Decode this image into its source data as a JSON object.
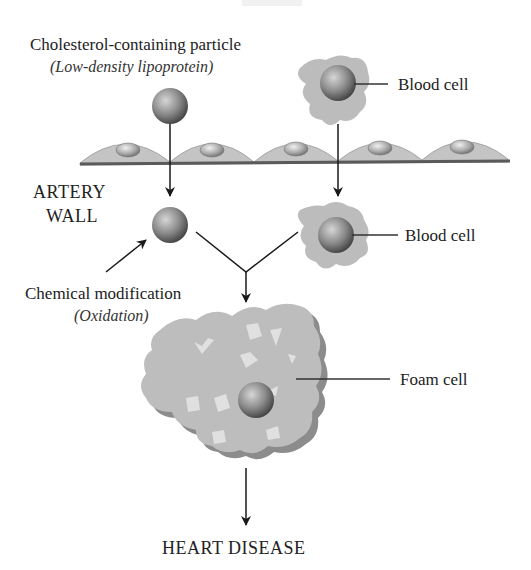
{
  "diagram": {
    "top_label_cropped": "BLOOD",
    "labels": {
      "ldl_title": "Cholesterol-containing particle",
      "ldl_subtitle": "(Low-density lipoprotein)",
      "blood_cell_top": "Blood cell",
      "artery_wall_line1": "ARTERY",
      "artery_wall_line2": "WALL",
      "blood_cell_wall": "Blood cell",
      "chem_mod_title": "Chemical modification",
      "chem_mod_subtitle": "(Oxidation)",
      "foam_cell": "Foam cell",
      "outcome": "HEART DISEASE"
    },
    "colors": {
      "sphere_light": "#c8c8c8",
      "sphere_dark": "#4a4a4a",
      "cell_fill": "#bdbdbd",
      "cell_shadow": "#8c8c8c",
      "wall_fill": "#c4c4c4",
      "wall_base": "#5a5a5a",
      "arrow": "#1a1a1a"
    },
    "flow": [
      "Cholesterol-containing particle crosses artery wall",
      "Blood cell crosses artery wall",
      "Chemical modification (Oxidation) of particle",
      "Particle and blood cell combine into foam cell",
      "Foam cell leads to heart disease"
    ]
  }
}
